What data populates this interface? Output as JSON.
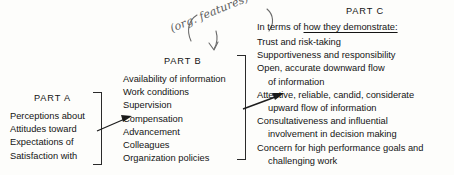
{
  "diagram": {
    "background_color": "#fdfdfb",
    "ink_color": "#141414",
    "annotation_color": "#5b5b5b"
  },
  "part_a": {
    "heading": "PART A",
    "items": [
      "Perceptions about",
      "Attitudes toward",
      "Expectations of",
      "Satisfaction with"
    ]
  },
  "part_b": {
    "heading": "PART B",
    "items": [
      "Availability of information",
      "Work conditions",
      "Supervision",
      "Compensation",
      "Advancement",
      "Colleagues",
      "Organization policies"
    ],
    "handwritten_annotation": "(org. features)"
  },
  "part_c": {
    "heading": "PART C",
    "intro_prefix": "In terms of",
    "intro_underlined": "how they demonstrate:",
    "items": [
      {
        "text": "Trust and risk-taking",
        "indent": false
      },
      {
        "text": "Supportiveness and responsibility",
        "indent": false
      },
      {
        "text": "Open, accurate downward flow",
        "indent": false
      },
      {
        "text": "of information",
        "indent": true
      },
      {
        "text": "Attentive, reliable, candid, considerate",
        "indent": false
      },
      {
        "text": "upward flow of information",
        "indent": true
      },
      {
        "text": "Consultativeness and influential",
        "indent": false
      },
      {
        "text": "involvement in decision making",
        "indent": true
      },
      {
        "text": "Concern for high performance goals and",
        "indent": false
      },
      {
        "text": "challenging work",
        "indent": true
      }
    ]
  }
}
